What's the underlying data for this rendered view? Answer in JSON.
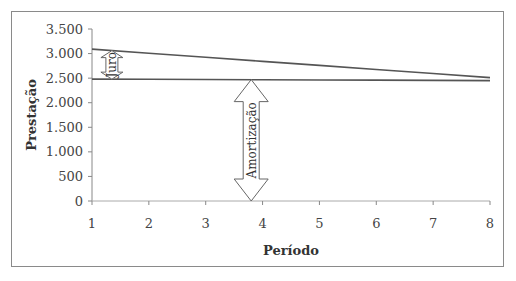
{
  "chart_data": {
    "type": "line",
    "title": "",
    "xlabel": "Período",
    "ylabel": "Prestação",
    "x": [
      1,
      2,
      3,
      4,
      5,
      6,
      7,
      8
    ],
    "x_tick_labels": [
      "1",
      "2",
      "3",
      "4",
      "5",
      "6",
      "7",
      "8"
    ],
    "y_tick_labels": [
      "0",
      "500",
      "1.000",
      "1.500",
      "2.000",
      "2.500",
      "3.000",
      "3.500"
    ],
    "y_ticks": [
      0,
      500,
      1000,
      1500,
      2000,
      2500,
      3000,
      3500
    ],
    "ylim": [
      0,
      3500
    ],
    "xlim": [
      1,
      8
    ],
    "grid": false,
    "legend": null,
    "series": [
      {
        "name": "Prestação",
        "values": [
          3090,
          3007,
          2924,
          2841,
          2759,
          2676,
          2593,
          2510
        ]
      },
      {
        "name": "Amortização",
        "values": [
          2480,
          2476,
          2471,
          2467,
          2463,
          2459,
          2454,
          2450
        ]
      }
    ],
    "annotations": [
      {
        "text": "Juro",
        "type": "double-arrow",
        "x": 1.35,
        "from": 2480,
        "to": 3060
      },
      {
        "text": "Amortização",
        "type": "double-arrow",
        "x": 3.8,
        "from": 0,
        "to": 2470
      }
    ],
    "line_color": "#555555"
  }
}
